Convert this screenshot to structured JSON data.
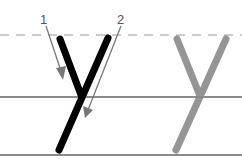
{
  "diagram": {
    "letter": "y",
    "stroke_labels": [
      "1",
      "2"
    ],
    "colors": {
      "example_letter": "#000000",
      "trace_letter": "#8a8a8a",
      "guide_lines": "#888888",
      "arrows": "#777777"
    }
  }
}
